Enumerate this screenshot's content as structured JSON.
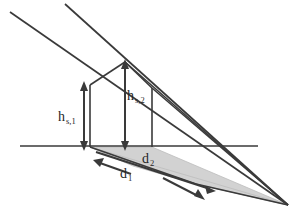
{
  "figure": {
    "type": "geometric-diagram",
    "background_color": "#ffffff",
    "line_color": "#3a3a3a",
    "shadow_fill_color": "#d2d2d2",
    "label_color": "#262626"
  },
  "labels": {
    "height_low": {
      "base": "h",
      "sub": "s,1"
    },
    "height_high": {
      "base": "h",
      "sub": "s,2"
    },
    "distance_short": {
      "base": "d",
      "sub": "2"
    },
    "distance_long": {
      "base": "d",
      "sub": "1"
    }
  },
  "geometry": {
    "ground_line": {
      "x1": 20,
      "y1": 146,
      "x2": 258,
      "y2": 146
    },
    "convergence_point": {
      "x": 288,
      "y": 205
    },
    "building": {
      "left_wall_top": {
        "x": 90,
        "y": 85
      },
      "left_wall_base": {
        "x": 90,
        "y": 146
      },
      "apex": {
        "x": 125,
        "y": 62
      },
      "right_wall_top": {
        "x": 152,
        "y": 88
      },
      "right_wall_base": {
        "x": 152,
        "y": 146
      }
    },
    "sun_rays": [
      {
        "x1": 10,
        "y1": 12,
        "x2": 288,
        "y2": 205
      },
      {
        "x1": 65,
        "y1": 4,
        "x2": 288,
        "y2": 205
      }
    ],
    "dimension_arrows": {
      "h_s1": {
        "x": 84,
        "y_top": 85,
        "y_bottom": 147
      },
      "h_s2": {
        "x": 125,
        "y_top": 62,
        "y_bottom": 147
      },
      "d1_head": {
        "x": 96,
        "y": 160
      },
      "d1_tail": {
        "x": 206,
        "y": 196
      },
      "d2_line": {
        "x1": 92,
        "y1": 150,
        "x2": 214,
        "y2": 190
      }
    }
  }
}
